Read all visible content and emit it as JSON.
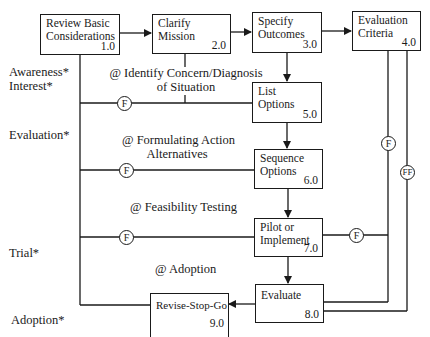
{
  "boxes": [
    {
      "id": "1.0",
      "title_line1": "Review Basic",
      "title_line2": "Considerations",
      "number": "1.0"
    },
    {
      "id": "2.0",
      "title_line1": "Clarify",
      "title_line2": "Mission",
      "number": "2.0"
    },
    {
      "id": "3.0",
      "title_line1": "Specify",
      "title_line2": "Outcomes",
      "number": "3.0"
    },
    {
      "id": "4.0",
      "title_line1": "Evaluation",
      "title_line2": "Criteria",
      "number": "4.0"
    },
    {
      "id": "5.0",
      "title_line1": "List",
      "title_line2": "Options",
      "number": "5.0"
    },
    {
      "id": "6.0",
      "title_line1": "Sequence",
      "title_line2": "Options",
      "number": "6.0"
    },
    {
      "id": "7.0",
      "title_line1": "Pilot or",
      "title_line2": "Implement",
      "number": "7.0"
    },
    {
      "id": "8.0",
      "title_line1": "Evaluate",
      "title_line2": "",
      "number": "8.0"
    },
    {
      "id": "9.0",
      "title_line1": "Revise-Stop-Go",
      "title_line2": "",
      "number": "9.0"
    }
  ],
  "stage_labels": {
    "awareness": "Awareness*",
    "interest": "Interest*",
    "evaluation": "Evaluation*",
    "trial": "Trial*",
    "adoption": "Adoption*"
  },
  "phase_labels": {
    "identify_line1": "@ Identify Concern/Diagnosis",
    "identify_line2": "of Situation",
    "formulating_line1": "@ Formulating Action",
    "formulating_line2": "Alternatives",
    "feasibility": "@ Feasibility Testing",
    "adoption": "@ Adoption"
  },
  "feedback_markers": {
    "f": "F",
    "ff": "FF"
  }
}
